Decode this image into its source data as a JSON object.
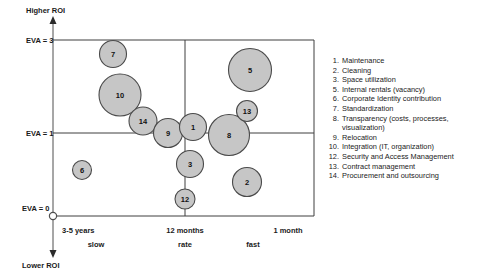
{
  "chart_data": {
    "type": "scatter",
    "title": "",
    "subtitle": "",
    "xlabel": "rate",
    "ylabel": "",
    "grid": false,
    "legend_position": "right",
    "y_axis": {
      "top_label": "Higher ROI",
      "bottom_label": "Lower ROI",
      "ticks": [
        {
          "value": 3,
          "label": "EVA = 3"
        },
        {
          "value": 1,
          "label": "EVA = 1"
        },
        {
          "value": 0,
          "label": "EVA =  0"
        }
      ],
      "ylim": [
        0,
        3.6
      ]
    },
    "x_axis": {
      "label": "rate",
      "categories": [
        {
          "primary": "3-5 years",
          "secondary": "slow"
        },
        {
          "primary": "12 months",
          "secondary": "rate"
        },
        {
          "primary": "1 month",
          "secondary": "fast"
        }
      ]
    },
    "quadrant_divider_x_label": "12 months",
    "points": [
      {
        "id": 7,
        "label": "7",
        "cx": 113,
        "cy": 54,
        "r": 13.5,
        "eva": 2.6,
        "speed": "slow"
      },
      {
        "id": 10,
        "label": "10",
        "cx": 120,
        "cy": 95,
        "r": 21.0,
        "eva": 1.75,
        "speed": "slow"
      },
      {
        "id": 14,
        "label": "14",
        "cx": 143,
        "cy": 121,
        "r": 14.0,
        "eva": 1.25,
        "speed": "slow"
      },
      {
        "id": 9,
        "label": "9",
        "cx": 168,
        "cy": 133,
        "r": 14.5,
        "eva": 1.0,
        "speed": "slow"
      },
      {
        "id": 1,
        "label": "1",
        "cx": 193,
        "cy": 127,
        "r": 13.5,
        "eva": 1.1,
        "speed": "fast"
      },
      {
        "id": 8,
        "label": "8",
        "cx": 229,
        "cy": 135,
        "r": 20.5,
        "eva": 0.95,
        "speed": "fast"
      },
      {
        "id": 13,
        "label": "13",
        "cx": 247,
        "cy": 111,
        "r": 10.5,
        "eva": 1.4,
        "speed": "fast"
      },
      {
        "id": 5,
        "label": "5",
        "cx": 250,
        "cy": 70,
        "r": 21.5,
        "eva": 2.2,
        "speed": "fast"
      },
      {
        "id": 3,
        "label": "3",
        "cx": 190,
        "cy": 164,
        "r": 13.5,
        "eva": 0.6,
        "speed": "fast"
      },
      {
        "id": 12,
        "label": "12",
        "cx": 185,
        "cy": 199,
        "r": 10.0,
        "eva": 0.2,
        "speed": "fast"
      },
      {
        "id": 2,
        "label": "2",
        "cx": 247,
        "cy": 182,
        "r": 14.5,
        "eva": 0.4,
        "speed": "fast"
      },
      {
        "id": 6,
        "label": "6",
        "cx": 82,
        "cy": 170,
        "r": 9.5,
        "eva": 0.5,
        "speed": "slow"
      }
    ],
    "legend": [
      {
        "num": "1.",
        "label": "Maintenance"
      },
      {
        "num": "2.",
        "label": "Cleaning"
      },
      {
        "num": "3.",
        "label": "Space utilization"
      },
      {
        "num": "5.",
        "label": "Internal rentals (vacancy)"
      },
      {
        "num": "6.",
        "label": "Corporate Identity contribution"
      },
      {
        "num": "7.",
        "label": "Standardization"
      },
      {
        "num": "8.",
        "label": "Transparency (costs, processes,",
        "cont": "visualization)"
      },
      {
        "num": "9.",
        "label": "Relocation"
      },
      {
        "num": "10.",
        "label": "Integration (IT, organization)"
      },
      {
        "num": "12.",
        "label": "Security and Access Management"
      },
      {
        "num": "13.",
        "label": "Contract management"
      },
      {
        "num": "14.",
        "label": "Procurement and outsourcing"
      }
    ],
    "colors": {
      "bubble_fill": "#c6c6c6",
      "bubble_stroke": "#4a4a4a",
      "axis": "#4f4f4f",
      "text": "#1a1a1a"
    }
  }
}
